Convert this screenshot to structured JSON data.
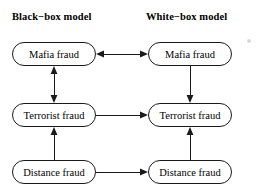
{
  "figure": {
    "width": 261,
    "height": 189,
    "background_color": "#ffffff",
    "stroke_color": "#1a1a1a",
    "type": "flow-diagram"
  },
  "columns": [
    {
      "id": "black-box",
      "title": "Black−box model"
    },
    {
      "id": "white-box",
      "title": "White−box model"
    }
  ],
  "nodes": [
    {
      "id": "bb-mafia",
      "column": "black-box",
      "row": "mafia",
      "label": "Mafia fraud"
    },
    {
      "id": "wb-mafia",
      "column": "white-box",
      "row": "mafia",
      "label": "Mafia fraud"
    },
    {
      "id": "bb-terrorist",
      "column": "black-box",
      "row": "terrorist",
      "label": "Terrorist fraud"
    },
    {
      "id": "wb-terrorist",
      "column": "white-box",
      "row": "terrorist",
      "label": "Terrorist fraud"
    },
    {
      "id": "bb-distance",
      "column": "black-box",
      "row": "distance",
      "label": "Distance fraud"
    },
    {
      "id": "wb-distance",
      "column": "white-box",
      "row": "distance",
      "label": "Distance fraud"
    }
  ],
  "edges": [
    {
      "id": "mafia-bidirectional",
      "from": "bb-mafia",
      "to": "wb-mafia",
      "direction": "both",
      "orientation": "horizontal"
    },
    {
      "id": "bb-mafia-terrorist",
      "from": "bb-mafia",
      "to": "bb-terrorist",
      "direction": "both",
      "orientation": "vertical"
    },
    {
      "id": "wb-mafia-terrorist",
      "from": "wb-mafia",
      "to": "wb-terrorist",
      "direction": "forward",
      "orientation": "vertical"
    },
    {
      "id": "bb-distance-terrorist",
      "from": "bb-distance",
      "to": "bb-terrorist",
      "direction": "forward",
      "orientation": "vertical"
    },
    {
      "id": "wb-distance-terrorist",
      "from": "wb-distance",
      "to": "wb-terrorist",
      "direction": "forward",
      "orientation": "vertical"
    },
    {
      "id": "terrorist-cross",
      "from": "bb-terrorist",
      "to": "wb-terrorist",
      "direction": "forward",
      "orientation": "horizontal"
    },
    {
      "id": "distance-cross",
      "from": "bb-distance",
      "to": "wb-distance",
      "direction": "forward",
      "orientation": "horizontal"
    }
  ],
  "artifacts": [
    {
      "id": "speck",
      "shape": "dot",
      "color": "#d8d8d8"
    }
  ]
}
